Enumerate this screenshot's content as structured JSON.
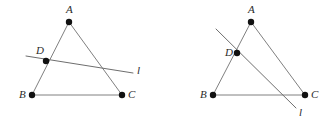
{
  "figure_set": {
    "background_color": "#ffffff",
    "stroke_color": "#808080",
    "dot_color": "#111111",
    "label_color": "#2b2b2b",
    "width": 336,
    "height": 124
  },
  "figures": [
    {
      "id": "left-figure",
      "description": "Triangle ABC with point D on side AB and line l through D crossing side AC",
      "points": {
        "A": {
          "label": "A",
          "x": 69,
          "y": 22,
          "label_x": 66,
          "label_y": 13
        },
        "B": {
          "label": "B",
          "x": 32,
          "y": 95,
          "label_x": 19,
          "label_y": 98
        },
        "C": {
          "label": "C",
          "x": 122,
          "y": 95,
          "label_x": 128,
          "label_y": 98
        },
        "D": {
          "label": "D",
          "x": 46,
          "y": 61,
          "label_x": 36,
          "label_y": 54
        }
      },
      "segments": [
        {
          "name": "AB",
          "from": "A",
          "to": "B"
        },
        {
          "name": "AC",
          "from": "A",
          "to": "C"
        },
        {
          "name": "BC",
          "from": "B",
          "to": "C"
        }
      ],
      "line": {
        "label": "l",
        "x1": 26,
        "y1": 56,
        "x2": 133,
        "y2": 73,
        "label_x": 137,
        "label_y": 74
      }
    },
    {
      "id": "right-figure",
      "description": "Triangle ABC with point D on side AB and line l through D crossing side BC",
      "points": {
        "A": {
          "label": "A",
          "x": 83,
          "y": 22,
          "label_x": 80,
          "label_y": 13
        },
        "B": {
          "label": "B",
          "x": 45,
          "y": 95,
          "label_x": 32,
          "label_y": 98
        },
        "C": {
          "label": "C",
          "x": 137,
          "y": 95,
          "label_x": 143,
          "label_y": 98
        },
        "D": {
          "label": "D",
          "x": 69,
          "y": 53,
          "label_x": 57,
          "label_y": 56
        }
      },
      "segments": [
        {
          "name": "AB",
          "from": "A",
          "to": "B"
        },
        {
          "name": "AC",
          "from": "A",
          "to": "C"
        },
        {
          "name": "BC",
          "from": "B",
          "to": "C"
        }
      ],
      "line": {
        "label": "l",
        "x1": 48,
        "y1": 29,
        "x2": 128,
        "y2": 108,
        "label_x": 131,
        "label_y": 116
      }
    }
  ]
}
